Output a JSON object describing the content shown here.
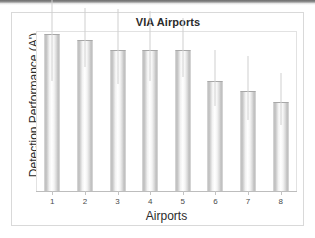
{
  "chart_data": {
    "type": "bar",
    "title": "VIA Airports",
    "xlabel": "Airports",
    "ylabel": "Detection Performance (A')",
    "categories": [
      "1",
      "2",
      "3",
      "4",
      "5",
      "6",
      "7",
      "8"
    ],
    "values": [
      1.0,
      0.96,
      0.9,
      0.9,
      0.9,
      0.7,
      0.64,
      0.57
    ],
    "errors_upper": [
      0.36,
      0.21,
      0.26,
      0.25,
      0.2,
      0.2,
      0.22,
      0.18
    ],
    "errors_lower": [
      0.3,
      0.17,
      0.22,
      0.2,
      0.17,
      0.16,
      0.19,
      0.15
    ],
    "ylim": [
      0,
      1.02
    ],
    "yticks": [],
    "ytick_labels": [],
    "grid": false,
    "legend": false,
    "legend_position": "none",
    "bar_fill": "#f0f0f0",
    "bar_edge": "#a8a8a8",
    "error_color": "#d0d0d0",
    "axis_color": "#bdbdbd",
    "text_color": "#2b2b2b"
  },
  "figure": {
    "frame_color": "#d9d9d9",
    "background": "#ffffff"
  }
}
